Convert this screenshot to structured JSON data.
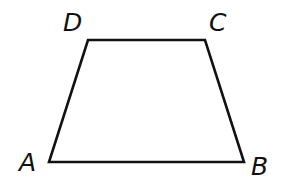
{
  "figure": {
    "type": "trapezoid",
    "vertices": [
      {
        "label": "A",
        "x": 49,
        "y": 162
      },
      {
        "label": "B",
        "x": 244,
        "y": 162
      },
      {
        "label": "C",
        "x": 205,
        "y": 40
      },
      {
        "label": "D",
        "x": 88,
        "y": 40
      }
    ],
    "labels": {
      "A": "A",
      "B": "B",
      "C": "C",
      "D": "D"
    },
    "stroke_color": "#111111",
    "background_color": "#ffffff"
  }
}
